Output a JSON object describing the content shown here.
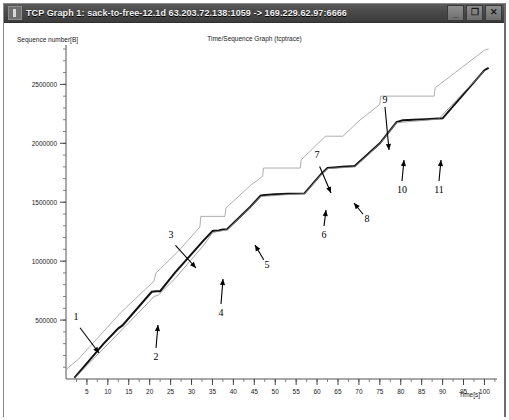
{
  "window": {
    "title": "TCP Graph 1: sack-to-free-12.1d 63.203.72.138:1059 -> 169.229.62.97:6666",
    "icon": "tcp-graph-icon",
    "controls": {
      "minimize": "_",
      "maximize": "❐",
      "close": "✕"
    },
    "frame_color": "#8a8a8a",
    "titlebar_color": "#4a4a4a"
  },
  "chart_data": {
    "type": "line",
    "title": "Time/Sequence Graph (tcptrace)",
    "xlabel": "Time[s]",
    "ylabel": "Sequence number[B]",
    "xlim": [
      0,
      103
    ],
    "ylim": [
      0,
      2800000
    ],
    "xticks": [
      5,
      10,
      15,
      20,
      25,
      30,
      35,
      40,
      45,
      50,
      55,
      60,
      65,
      70,
      75,
      80,
      85,
      90,
      95,
      100
    ],
    "yticks": [
      500000,
      1000000,
      1500000,
      2000000,
      2500000
    ],
    "ytick_labels": [
      "500000",
      "1000000",
      "1500000",
      "2000000",
      "2500000"
    ],
    "xtick_minor_step": 2.5,
    "ytick_minor_step": 100000,
    "grid": false,
    "legend": "none",
    "series": [
      {
        "name": "receive-window-line",
        "color": "#9a9a9a",
        "width": 0.8,
        "points": [
          [
            0,
            80000
          ],
          [
            3,
            170000
          ],
          [
            13,
            560000
          ],
          [
            21,
            830000
          ],
          [
            21.5,
            900000
          ],
          [
            27,
            1090000
          ],
          [
            32,
            1290000
          ],
          [
            32.2,
            1380000
          ],
          [
            38,
            1380000
          ],
          [
            38.2,
            1450000
          ],
          [
            44,
            1640000
          ],
          [
            47,
            1720000
          ],
          [
            47.2,
            1790000
          ],
          [
            56,
            1790000
          ],
          [
            56.2,
            1860000
          ],
          [
            62,
            2060000
          ],
          [
            62.5,
            2060000
          ],
          [
            66,
            2060000
          ],
          [
            66.2,
            2060000
          ],
          [
            70,
            2190000
          ],
          [
            75,
            2330000
          ],
          [
            75.2,
            2400000
          ],
          [
            88,
            2400000
          ],
          [
            88.2,
            2470000
          ],
          [
            100,
            2790000
          ],
          [
            101,
            2800000
          ]
        ]
      },
      {
        "name": "data-sequence-line",
        "color": "#111111",
        "width": 2.0,
        "points": [
          [
            2,
            10000
          ],
          [
            9,
            300000
          ],
          [
            12.5,
            430000
          ],
          [
            13.5,
            455000
          ],
          [
            19.5,
            700000
          ],
          [
            20.5,
            740000
          ],
          [
            21.5,
            745000
          ],
          [
            22.5,
            745000
          ],
          [
            26,
            900000
          ],
          [
            33,
            1180000
          ],
          [
            35,
            1255000
          ],
          [
            35.3,
            1258000
          ],
          [
            36.5,
            1260000
          ],
          [
            37.5,
            1268000
          ],
          [
            38.5,
            1270000
          ],
          [
            44,
            1460000
          ],
          [
            46.5,
            1555000
          ],
          [
            47,
            1560000
          ],
          [
            50,
            1568000
          ],
          [
            53,
            1572000
          ],
          [
            57,
            1575000
          ],
          [
            61,
            1740000
          ],
          [
            62.5,
            1790000
          ],
          [
            64,
            1795000
          ],
          [
            66,
            1800000
          ],
          [
            68,
            1805000
          ],
          [
            69,
            1808000
          ],
          [
            75,
            2000000
          ],
          [
            79,
            2180000
          ],
          [
            80.5,
            2195000
          ],
          [
            83,
            2200000
          ],
          [
            86,
            2205000
          ],
          [
            89,
            2210000
          ],
          [
            90,
            2212000
          ],
          [
            100,
            2620000
          ],
          [
            101,
            2640000
          ]
        ]
      },
      {
        "name": "ack-line",
        "color": "#8e8e8e",
        "width": 0.8,
        "points": [
          [
            2,
            5000
          ],
          [
            20,
            660000
          ],
          [
            21,
            700000
          ],
          [
            22,
            710000
          ],
          [
            26,
            850000
          ],
          [
            33,
            1140000
          ],
          [
            35,
            1240000
          ],
          [
            36,
            1250000
          ],
          [
            38.5,
            1265000
          ],
          [
            44,
            1455000
          ],
          [
            46.5,
            1548000
          ],
          [
            53,
            1565000
          ],
          [
            57,
            1570000
          ],
          [
            61,
            1735000
          ],
          [
            62.5,
            1785000
          ],
          [
            69,
            1800000
          ],
          [
            75,
            1995000
          ],
          [
            79,
            2175000
          ],
          [
            89,
            2205000
          ],
          [
            100,
            2615000
          ]
        ]
      }
    ],
    "annotations": [
      {
        "id": "1",
        "label": "1",
        "label_x": 72,
        "label_y": 297,
        "tip_x": 95,
        "tip_y": 330,
        "style": "diagonal-arrow"
      },
      {
        "id": "2",
        "label": "2",
        "label_x": 152,
        "label_y": 337,
        "tip_x": 154,
        "tip_y": 302,
        "style": "up-arrow"
      },
      {
        "id": "3",
        "label": "3",
        "label_x": 167,
        "label_y": 215,
        "tip_x": 192,
        "tip_y": 245,
        "style": "diagonal-arrow"
      },
      {
        "id": "4",
        "label": "4",
        "label_x": 217,
        "label_y": 293,
        "tip_x": 219,
        "tip_y": 256,
        "style": "up-arrow"
      },
      {
        "id": "5",
        "label": "5",
        "label_x": 263,
        "label_y": 245,
        "tip_x": 251,
        "tip_y": 222,
        "style": "diagonal-arrow"
      },
      {
        "id": "6",
        "label": "6",
        "label_x": 320,
        "label_y": 215,
        "tip_x": 322,
        "tip_y": 187,
        "style": "up-arrow"
      },
      {
        "id": "7",
        "label": "7",
        "label_x": 313,
        "label_y": 135,
        "tip_x": 327,
        "tip_y": 170,
        "style": "diagonal-arrow"
      },
      {
        "id": "8",
        "label": "8",
        "label_x": 363,
        "label_y": 199,
        "tip_x": 350,
        "tip_y": 180,
        "style": "diagonal-arrow"
      },
      {
        "id": "9",
        "label": "9",
        "label_x": 381,
        "label_y": 80,
        "tip_x": 385,
        "tip_y": 127,
        "style": "down-arrow"
      },
      {
        "id": "10",
        "label": "10",
        "label_x": 398,
        "label_y": 170,
        "tip_x": 400,
        "tip_y": 137,
        "style": "up-arrow"
      },
      {
        "id": "11",
        "label": "11",
        "label_x": 435,
        "label_y": 170,
        "tip_x": 437,
        "tip_y": 137,
        "style": "up-arrow"
      }
    ]
  }
}
